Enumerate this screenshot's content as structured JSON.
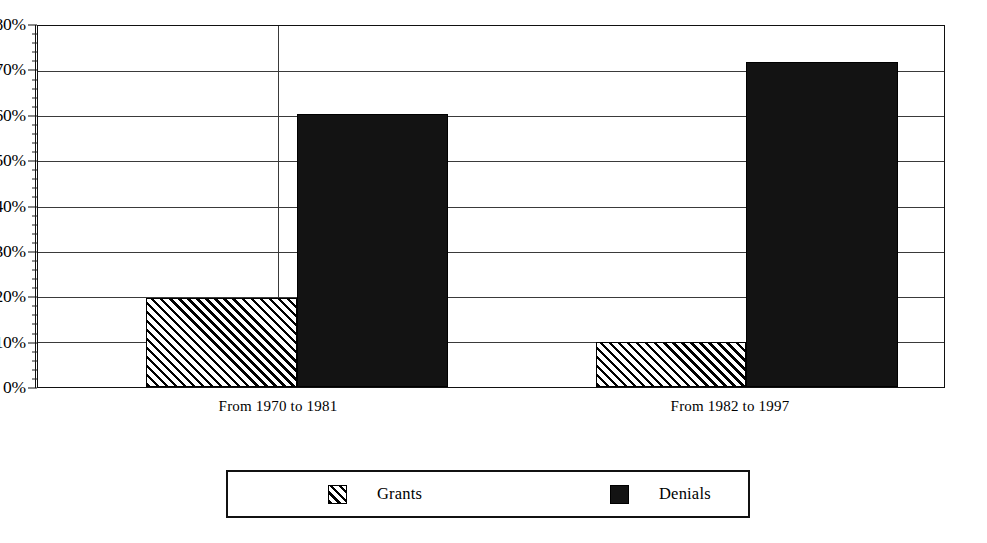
{
  "chart_data": {
    "type": "bar",
    "title": "",
    "subtitle": "",
    "xlabel": "",
    "ylabel": "",
    "ylim": [
      0,
      80
    ],
    "ytick_step": 10,
    "yminor_step": 2,
    "ytick_format": "percent",
    "grid": true,
    "grid_axis": "y",
    "group_separator": true,
    "legend_position": "bottom",
    "categories": [
      "From 1970 to 1981",
      "From 1982 to 1997"
    ],
    "y_tick_labels": [
      "0%",
      "10%",
      "20%",
      "30%",
      "40%",
      "50%",
      "60%",
      "70%",
      "80%"
    ],
    "y_tick_values": [
      0,
      10,
      20,
      30,
      40,
      50,
      60,
      70,
      80
    ],
    "series": [
      {
        "name": "Grants",
        "fill": "diagonal-hatch",
        "color": "#000000",
        "values": [
          19.7,
          10.0
        ],
        "value_labels": [
          "19.7%",
          "10.0%"
        ]
      },
      {
        "name": "Denials",
        "fill": "solid",
        "color": "#131313",
        "values": [
          60.6,
          72.0
        ],
        "value_labels": [
          "60.6%",
          "72.0%"
        ]
      }
    ]
  },
  "axis": {
    "y_labels": [
      "80%",
      "70%",
      "60%",
      "50%",
      "40%",
      "30%",
      "20%",
      "10%",
      "0%"
    ]
  },
  "legend": {
    "entries": [
      {
        "label": "Grants",
        "swatch": "diagonal-hatch-swatch"
      },
      {
        "label": "Denials",
        "swatch": "solid-black-swatch"
      }
    ]
  },
  "colors": {
    "denials": "#131313",
    "grants_hatch": "#000000",
    "frame": "#111111",
    "gridline": "#3a3a3a",
    "background": "#ffffff"
  }
}
